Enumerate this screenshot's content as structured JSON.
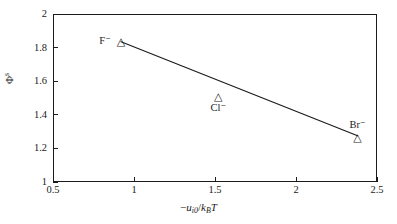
{
  "chart_data": {
    "type": "scatter",
    "title": "",
    "xlabel": "-u_i0/k_B T",
    "ylabel": "Φ^s",
    "xlim": [
      0.5,
      2.5
    ],
    "ylim": [
      1,
      2
    ],
    "grid": false,
    "legend": "none",
    "x_ticks": [
      "0.5",
      "1",
      "1.5",
      "2",
      "2.5"
    ],
    "x_tick_values": [
      0.5,
      1,
      1.5,
      2,
      2.5
    ],
    "y_ticks": [
      "1",
      "1.2",
      "1.4",
      "1.6",
      "1.8",
      "2"
    ],
    "y_tick_values": [
      1,
      1.2,
      1.4,
      1.6,
      1.8,
      2
    ],
    "marker": "open-triangle",
    "points": [
      {
        "label": "F⁻",
        "x": 0.92,
        "y": 1.84,
        "label_pos": "left"
      },
      {
        "label": "Cl⁻",
        "x": 1.52,
        "y": 1.51,
        "label_pos": "below"
      },
      {
        "label": "Br⁻",
        "x": 2.38,
        "y": 1.27,
        "label_pos": "above"
      }
    ],
    "trendline": {
      "x": [
        0.92,
        2.38
      ],
      "y": [
        1.835,
        1.275
      ]
    }
  },
  "axis_labels": {
    "x_prefix": "−",
    "x_var": "u",
    "x_sub": "i0",
    "x_div": "/",
    "x_k": "k",
    "x_k_sub": "B",
    "x_T": "T",
    "y_phi": "Φ",
    "y_sup": "s"
  },
  "style": {
    "background": "#ffffff",
    "axis_color": "#1b1b1b",
    "line_color": "#1b1b1b",
    "text_color": "#1b1b1b"
  },
  "markers": {
    "triangle_glyph": "△"
  }
}
